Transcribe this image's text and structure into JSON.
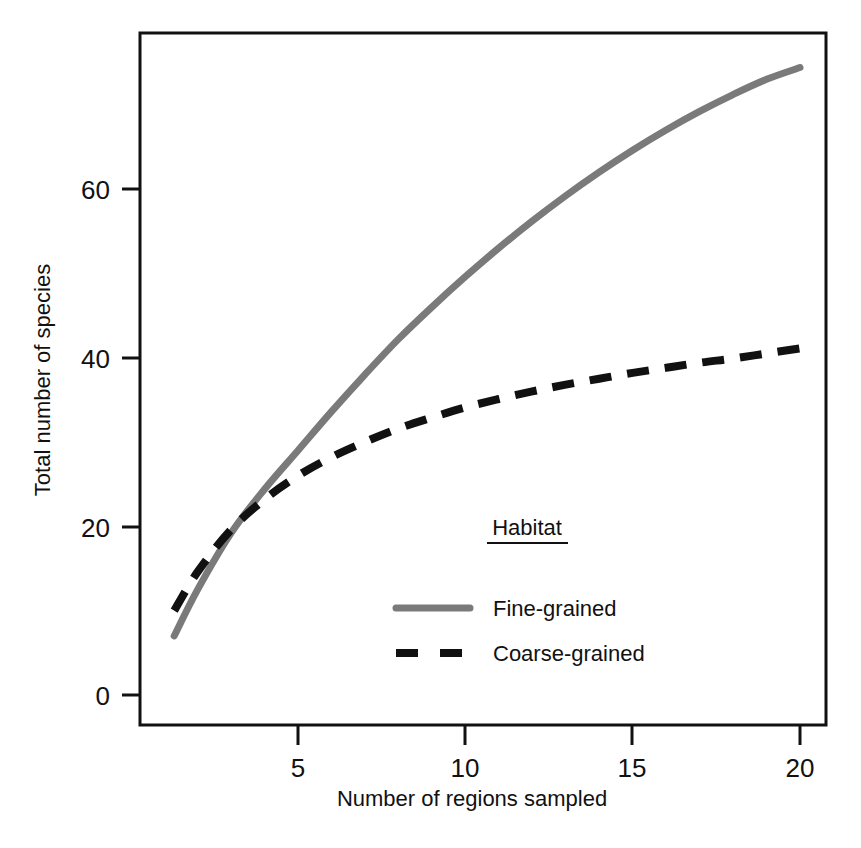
{
  "chart_data": {
    "type": "line",
    "title": "",
    "xlabel": "Number of regions sampled",
    "ylabel": "Total number of species",
    "xlim": [
      1.3,
      20
    ],
    "ylim": [
      0,
      78
    ],
    "xticks": [
      5,
      10,
      15,
      20
    ],
    "xtick_labels": [
      "5",
      "10",
      "15",
      "20"
    ],
    "yticks": [
      0,
      20,
      40,
      60
    ],
    "ytick_labels": [
      "0",
      "20",
      "40",
      "60"
    ],
    "grid": false,
    "legend_position": "inside-center-right",
    "legend_title": "Habitat",
    "x": [
      1.3,
      2,
      3,
      4,
      5,
      6,
      7,
      8,
      9,
      10,
      11,
      12,
      13,
      14,
      15,
      16,
      17,
      18,
      19,
      20
    ],
    "series": [
      {
        "name": "Fine-grained",
        "style": "solid",
        "color": "#7a7a7a",
        "values": [
          7.0,
          12.5,
          19.2,
          24.4,
          29.0,
          33.6,
          38.0,
          42.2,
          46.0,
          49.6,
          53.0,
          56.2,
          59.2,
          62.0,
          64.6,
          67.0,
          69.2,
          71.2,
          73.0,
          74.4
        ]
      },
      {
        "name": "Coarse-grained",
        "style": "dashed",
        "color": "#111111",
        "values": [
          10.0,
          14.6,
          19.6,
          23.2,
          26.0,
          28.2,
          30.0,
          31.6,
          32.9,
          34.1,
          35.1,
          36.0,
          36.8,
          37.5,
          38.2,
          38.8,
          39.4,
          39.9,
          40.5,
          41.1
        ]
      }
    ],
    "annotations": []
  },
  "axes": {
    "y_title": "Total number of species",
    "x_title": "Number of regions sampled",
    "ytick_0": "0",
    "ytick_20": "20",
    "ytick_40": "40",
    "ytick_60": "60",
    "xtick_5": "5",
    "xtick_10": "10",
    "xtick_15": "15",
    "xtick_20": "20"
  },
  "legend": {
    "title": "Habitat",
    "items": [
      {
        "label": "Fine-grained",
        "color": "#7a7a7a",
        "style": "solid"
      },
      {
        "label": "Coarse-grained",
        "color": "#111111",
        "style": "dashed"
      }
    ]
  },
  "colors": {
    "fine_grained": "#7a7a7a",
    "coarse_grained": "#111111",
    "axis": "#111111",
    "background": "#ffffff"
  }
}
